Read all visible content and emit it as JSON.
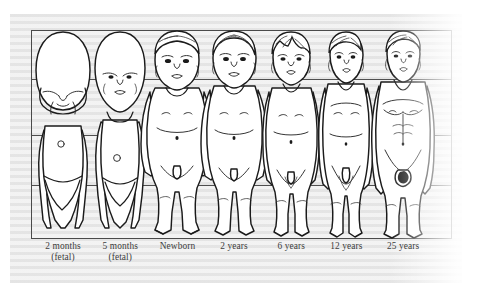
{
  "illustration": {
    "title": "Human body proportions at successive stages of growth",
    "type": "anatomical-proportion-plate",
    "frame": {
      "border_color": "#4a4a4a",
      "background_color": "#ffffff"
    },
    "background": {
      "style": "horizontal-striped-paper",
      "color_light": "#f2f2f2",
      "color_dark": "#e3e3e3"
    },
    "proportion_lines": {
      "count": 3,
      "color": "#4f4f4f",
      "positions_pct": [
        23.0,
        50.2,
        74.2
      ],
      "description": "Horizontal reference lines marking equal body divisions"
    },
    "stages": [
      {
        "id": "fetal-2mo",
        "label_line1": "2 months",
        "label_line2": "(fetal)",
        "center_pct": 7.6,
        "head_ratio": "1/2"
      },
      {
        "id": "fetal-5mo",
        "label_line1": "5 months",
        "label_line2": "(fetal)",
        "center_pct": 21.2,
        "head_ratio": "1/3"
      },
      {
        "id": "newborn",
        "label_line1": "Newborn",
        "label_line2": "",
        "center_pct": 34.8,
        "head_ratio": "1/4"
      },
      {
        "id": "years-2",
        "label_line1": "2 years",
        "label_line2": "",
        "center_pct": 48.2,
        "head_ratio": "1/5"
      },
      {
        "id": "years-6",
        "label_line1": "6 years",
        "label_line2": "",
        "center_pct": 61.8,
        "head_ratio": "1/6"
      },
      {
        "id": "years-12",
        "label_line1": "12 years",
        "label_line2": "",
        "center_pct": 74.9,
        "head_ratio": "1/7"
      },
      {
        "id": "years-25",
        "label_line1": "25 years",
        "label_line2": "",
        "center_pct": 88.4,
        "head_ratio": "1/8"
      }
    ]
  }
}
